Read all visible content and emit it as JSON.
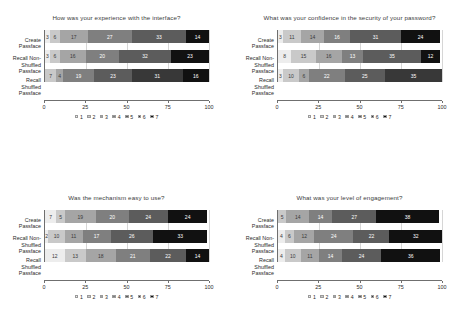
{
  "palette": {
    "c1": "#ededed",
    "c2": "#c9c9c9",
    "c3": "#a5a5a5",
    "c4": "#7f7f7f",
    "c5": "#5c5c5c",
    "c6": "#383838",
    "c7": "#111111"
  },
  "legend": {
    "items": [
      {
        "label": "1",
        "color": "#ededed"
      },
      {
        "label": "2",
        "color": "#c9c9c9"
      },
      {
        "label": "3",
        "color": "#a5a5a5"
      },
      {
        "label": "4",
        "color": "#7f7f7f"
      },
      {
        "label": "5",
        "color": "#5c5c5c"
      },
      {
        "label": "6",
        "color": "#383838"
      },
      {
        "label": "7",
        "color": "#111111"
      }
    ]
  },
  "axis": {
    "ticks": [
      "0",
      "25",
      "50",
      "75",
      "100"
    ],
    "min": 0,
    "max": 100
  },
  "categories": [
    [
      "Create",
      "Passface"
    ],
    [
      "Recall Non-",
      "Shuffled",
      "Passface"
    ],
    [
      "Recall",
      "Shuffled",
      "Passface"
    ]
  ],
  "chart_data": [
    {
      "type": "bar",
      "orientation": "horizontal",
      "stacked": true,
      "normalized_percent": true,
      "title": "How was your experience with the interface?",
      "xlabel": "",
      "ylabel": "",
      "xlim": [
        0,
        100
      ],
      "xticks": [
        0,
        25,
        50,
        75,
        100
      ],
      "grid": true,
      "legend_position": "bottom",
      "categories": [
        "Create Passface",
        "Recall Non-Shuffled Passface",
        "Recall Shuffled Passface"
      ],
      "series": [
        {
          "name": "1",
          "values": [
            3,
            3,
            null
          ]
        },
        {
          "name": "2",
          "values": [
            6,
            6,
            7
          ]
        },
        {
          "name": "3",
          "values": [
            17,
            16,
            4
          ]
        },
        {
          "name": "4",
          "values": [
            27,
            20,
            19
          ]
        },
        {
          "name": "5",
          "values": [
            33,
            32,
            23
          ]
        },
        {
          "name": "6",
          "values": [
            14,
            23,
            31
          ]
        },
        {
          "name": "7",
          "values": [
            null,
            null,
            16
          ]
        }
      ],
      "rows": [
        {
          "category": "Create Passface",
          "segments": [
            {
              "level": "1",
              "value": 3,
              "label": "3"
            },
            {
              "level": "2",
              "value": 6,
              "label": "6"
            },
            {
              "level": "3",
              "value": 17,
              "label": "17"
            },
            {
              "level": "4",
              "value": 27,
              "label": "27"
            },
            {
              "level": "5",
              "value": 33,
              "label": "33"
            },
            {
              "level": "7",
              "value": 14,
              "label": "14"
            }
          ]
        },
        {
          "category": "Recall Non-Shuffled Passface",
          "segments": [
            {
              "level": "1",
              "value": 3,
              "label": "3"
            },
            {
              "level": "2",
              "value": 6,
              "label": "6"
            },
            {
              "level": "3",
              "value": 16,
              "label": "16"
            },
            {
              "level": "4",
              "value": 20,
              "label": "20"
            },
            {
              "level": "5",
              "value": 32,
              "label": "32"
            },
            {
              "level": "7",
              "value": 23,
              "label": "23"
            }
          ]
        },
        {
          "category": "Recall Shuffled Passface",
          "segments": [
            {
              "level": "2",
              "value": 7,
              "label": "7"
            },
            {
              "level": "3",
              "value": 4,
              "label": "4"
            },
            {
              "level": "4",
              "value": 19,
              "label": "19"
            },
            {
              "level": "5",
              "value": 23,
              "label": "23"
            },
            {
              "level": "6",
              "value": 31,
              "label": "31"
            },
            {
              "level": "7",
              "value": 16,
              "label": "16"
            }
          ]
        }
      ]
    },
    {
      "type": "bar",
      "orientation": "horizontal",
      "stacked": true,
      "normalized_percent": true,
      "title": "What was your confidence in the security of your password?",
      "xlabel": "",
      "ylabel": "",
      "xlim": [
        0,
        100
      ],
      "xticks": [
        0,
        25,
        50,
        75,
        100
      ],
      "grid": true,
      "legend_position": "bottom",
      "categories": [
        "Create Passface",
        "Recall Non-Shuffled Passface",
        "Recall Shuffled Passface"
      ],
      "rows": [
        {
          "category": "Create Passface",
          "segments": [
            {
              "level": "1",
              "value": 3,
              "label": "3"
            },
            {
              "level": "2",
              "value": 11,
              "label": "11"
            },
            {
              "level": "3",
              "value": 14,
              "label": "14"
            },
            {
              "level": "4",
              "value": 16,
              "label": "16"
            },
            {
              "level": "5",
              "value": 31,
              "label": "31"
            },
            {
              "level": "7",
              "value": 24,
              "label": "24"
            }
          ]
        },
        {
          "category": "Recall Non-Shuffled Passface",
          "segments": [
            {
              "level": "1",
              "value": 8,
              "label": "8"
            },
            {
              "level": "2",
              "value": 15,
              "label": "15"
            },
            {
              "level": "3",
              "value": 16,
              "label": "16"
            },
            {
              "level": "4",
              "value": 13,
              "label": "13"
            },
            {
              "level": "5",
              "value": 35,
              "label": "35"
            },
            {
              "level": "7",
              "value": 12,
              "label": "12"
            }
          ]
        },
        {
          "category": "Recall Shuffled Passface",
          "segments": [
            {
              "level": "1",
              "value": 3,
              "label": "3"
            },
            {
              "level": "2",
              "value": 10,
              "label": "10"
            },
            {
              "level": "3",
              "value": 6,
              "label": "6"
            },
            {
              "level": "4",
              "value": 22,
              "label": "22"
            },
            {
              "level": "5",
              "value": 25,
              "label": "25"
            },
            {
              "level": "6",
              "value": 35,
              "label": "35"
            }
          ]
        }
      ]
    },
    {
      "type": "bar",
      "orientation": "horizontal",
      "stacked": true,
      "normalized_percent": true,
      "title": "Was the mechanism easy to use?",
      "xlabel": "",
      "ylabel": "",
      "xlim": [
        0,
        100
      ],
      "xticks": [
        0,
        25,
        50,
        75,
        100
      ],
      "grid": true,
      "legend_position": "bottom",
      "categories": [
        "Create Passface",
        "Recall Non-Shuffled Passface",
        "Recall Shuffled Passface"
      ],
      "rows": [
        {
          "category": "Create Passface",
          "segments": [
            {
              "level": "1",
              "value": 7,
              "label": "7"
            },
            {
              "level": "2",
              "value": 5,
              "label": "5"
            },
            {
              "level": "3",
              "value": 19,
              "label": "19"
            },
            {
              "level": "4",
              "value": 20,
              "label": "20"
            },
            {
              "level": "5",
              "value": 24,
              "label": "24"
            },
            {
              "level": "7",
              "value": 24,
              "label": "24"
            }
          ]
        },
        {
          "category": "Recall Non-Shuffled Passface",
          "segments": [
            {
              "level": "1",
              "value": 2,
              "label": "2"
            },
            {
              "level": "2",
              "value": 10,
              "label": "10"
            },
            {
              "level": "3",
              "value": 11,
              "label": "11"
            },
            {
              "level": "4",
              "value": 17,
              "label": "17"
            },
            {
              "level": "5",
              "value": 26,
              "label": "26"
            },
            {
              "level": "7",
              "value": 33,
              "label": "33"
            }
          ]
        },
        {
          "category": "Recall Shuffled Passface",
          "segments": [
            {
              "level": "1",
              "value": 12,
              "label": "12"
            },
            {
              "level": "2",
              "value": 13,
              "label": "13"
            },
            {
              "level": "3",
              "value": 18,
              "label": "18"
            },
            {
              "level": "4",
              "value": 21,
              "label": "21"
            },
            {
              "level": "5",
              "value": 22,
              "label": "22"
            },
            {
              "level": "7",
              "value": 14,
              "label": "14"
            }
          ]
        }
      ]
    },
    {
      "type": "bar",
      "orientation": "horizontal",
      "stacked": true,
      "normalized_percent": true,
      "title": "What was your level of engagement?",
      "xlabel": "",
      "ylabel": "",
      "xlim": [
        0,
        100
      ],
      "xticks": [
        0,
        25,
        50,
        75,
        100
      ],
      "grid": true,
      "legend_position": "bottom",
      "categories": [
        "Create Passface",
        "Recall Non-Shuffled Passface",
        "Recall Shuffled Passface"
      ],
      "rows": [
        {
          "category": "Create Passface",
          "segments": [
            {
              "level": "2",
              "value": 5,
              "label": "5"
            },
            {
              "level": "3",
              "value": 14,
              "label": "14"
            },
            {
              "level": "4",
              "value": 14,
              "label": "14"
            },
            {
              "level": "5",
              "value": 27,
              "label": "27"
            },
            {
              "level": "7",
              "value": 38,
              "label": "38"
            }
          ]
        },
        {
          "category": "Recall Non-Shuffled Passface",
          "segments": [
            {
              "level": "1",
              "value": 4,
              "label": "4"
            },
            {
              "level": "2",
              "value": 6,
              "label": "6"
            },
            {
              "level": "3",
              "value": 12,
              "label": "12"
            },
            {
              "level": "4",
              "value": 24,
              "label": "24"
            },
            {
              "level": "5",
              "value": 22,
              "label": "22"
            },
            {
              "level": "7",
              "value": 32,
              "label": "32"
            }
          ]
        },
        {
          "category": "Recall Shuffled Passface",
          "segments": [
            {
              "level": "1",
              "value": 4,
              "label": "4"
            },
            {
              "level": "2",
              "value": 10,
              "label": "10"
            },
            {
              "level": "3",
              "value": 11,
              "label": "11"
            },
            {
              "level": "4",
              "value": 14,
              "label": "14"
            },
            {
              "level": "5",
              "value": 24,
              "label": "24"
            },
            {
              "level": "7",
              "value": 36,
              "label": "36"
            }
          ]
        }
      ]
    }
  ]
}
